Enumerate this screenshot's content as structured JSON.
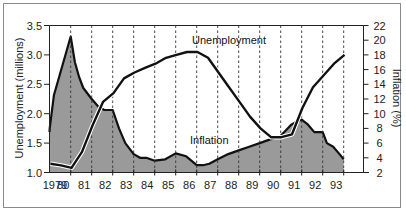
{
  "chart_data": {
    "type": "line",
    "title": "",
    "xlabel": "",
    "x_tick_labels": [
      "1979",
      "80",
      "81",
      "82",
      "83",
      "84",
      "85",
      "86",
      "87",
      "88",
      "89",
      "90",
      "91",
      "92",
      "93"
    ],
    "left_axis": {
      "label": "Unemployment (millions)",
      "ticks": [
        "1.0",
        "1.5",
        "2.0",
        "2.5",
        "3.0",
        "3.5"
      ],
      "range": [
        1.0,
        3.5
      ]
    },
    "right_axis": {
      "label": "Inflation (%)",
      "ticks": [
        "2",
        "4",
        "6",
        "8",
        "10",
        "12",
        "14",
        "16",
        "18",
        "20",
        "22"
      ],
      "range": [
        2,
        22
      ]
    },
    "grid": "vertical dashed lines at each year",
    "series": [
      {
        "name": "Unemployment",
        "axis": "left",
        "style": "line",
        "x": [
          1979.0,
          1979.5,
          1980.0,
          1980.5,
          1981.0,
          1981.5,
          1982.0,
          1982.5,
          1983.0,
          1983.5,
          1984.0,
          1984.5,
          1985.0,
          1985.5,
          1986.0,
          1986.5,
          1987.0,
          1987.5,
          1988.0,
          1988.5,
          1989.0,
          1989.5,
          1990.0,
          1990.5,
          1991.0,
          1991.5,
          1992.0,
          1992.5,
          1993.0
        ],
        "values": [
          1.15,
          1.12,
          1.08,
          1.35,
          1.8,
          2.2,
          2.35,
          2.6,
          2.7,
          2.78,
          2.85,
          2.95,
          3.0,
          3.05,
          3.05,
          2.95,
          2.7,
          2.45,
          2.2,
          1.95,
          1.75,
          1.6,
          1.6,
          1.65,
          2.1,
          2.45,
          2.65,
          2.85,
          3.0
        ]
      },
      {
        "name": "Inflation",
        "axis": "right",
        "style": "filled-area",
        "x": [
          1978.9,
          1979.0,
          1979.2,
          1979.5,
          1979.8,
          1980.0,
          1980.2,
          1980.4,
          1980.6,
          1981.0,
          1981.3,
          1981.6,
          1982.0,
          1982.3,
          1982.6,
          1983.0,
          1983.3,
          1983.6,
          1984.0,
          1984.5,
          1985.0,
          1985.5,
          1986.0,
          1986.3,
          1986.6,
          1987.0,
          1987.5,
          1988.0,
          1988.5,
          1989.0,
          1989.5,
          1990.0,
          1990.5,
          1990.8,
          1991.0,
          1991.3,
          1991.6,
          1992.0,
          1992.2,
          1992.5,
          1992.8,
          1993.0
        ],
        "values": [
          7.5,
          8.0,
          12.5,
          15.5,
          18.5,
          20.5,
          17.0,
          15.0,
          13.5,
          12.0,
          11.0,
          10.5,
          10.5,
          8.0,
          6.0,
          4.5,
          4.0,
          4.0,
          3.6,
          3.8,
          4.6,
          4.2,
          3.0,
          3.0,
          3.2,
          3.8,
          4.5,
          5.0,
          5.5,
          6.0,
          6.5,
          7.0,
          8.5,
          9.0,
          9.2,
          8.5,
          7.5,
          7.5,
          6.0,
          5.5,
          4.5,
          3.8
        ]
      }
    ],
    "annotations": [
      {
        "text": "Unemployment",
        "near_series": "Unemployment"
      },
      {
        "text": "Inflation",
        "near_series": "Inflation"
      }
    ]
  }
}
